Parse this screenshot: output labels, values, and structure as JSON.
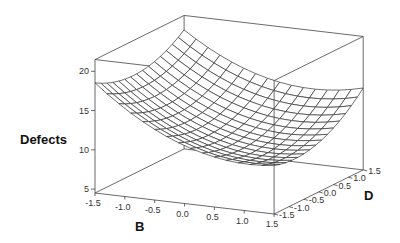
{
  "chart_data": {
    "type": "surface3d",
    "title": "",
    "zlabel": "Defects",
    "xlabel": "B",
    "ylabel": "D",
    "z_ticks": [
      "5",
      "10",
      "15",
      "20"
    ],
    "x_ticks": [
      "-1.5",
      "-1.0",
      "-0.5",
      "0.0",
      "0.5",
      "1.0",
      "1.5"
    ],
    "y_ticks": [
      "-1.5",
      "-1.0",
      "-0.5",
      "0.0",
      "0.5",
      "1.0",
      "1.5"
    ],
    "xlim": [
      -1.5,
      1.5
    ],
    "ylim": [
      -1.5,
      1.5
    ],
    "zlim": [
      4.5,
      21.5
    ],
    "grid_size": 15,
    "surface_samples": [
      {
        "B": -1.5,
        "D": -1.5,
        "Defects": 16.2
      },
      {
        "B": -1.5,
        "D": 1.5,
        "Defects": 19.4
      },
      {
        "B": 1.5,
        "D": 1.5,
        "Defects": 11.8
      },
      {
        "B": 1.5,
        "D": -1.5,
        "Defects": 7.8
      }
    ]
  }
}
